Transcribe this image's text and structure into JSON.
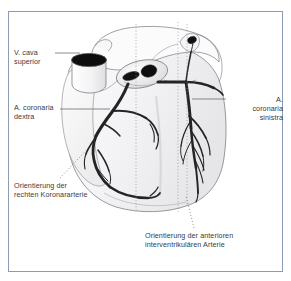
{
  "figure": {
    "type": "anatomical-illustration",
    "frame_color": "#8e9bb5",
    "background_color": "#ffffff",
    "text_color": "#3a3a3c",
    "artery_color": "#2b2b2b",
    "outline_color": "#6e6e73"
  },
  "labels": {
    "vena_cava_superior": "V. cava\nsuperior",
    "a_coronaria_dextra": "A. coronaria\ndextra",
    "a_coronaria_sinistra": "A. coronaria\nsinistra",
    "orientation_rca": "Orientierung der\nrechten Koronararterie",
    "orientation_lad": "Orientierung der anterioren\ninterventrikulären Arterie"
  },
  "anatomy": {
    "vena_cava_opening": "vena-cava-superior-opening",
    "aorta_opening": "aorta-opening",
    "pulmonary_trunk_opening": "pulmonary-trunk-opening",
    "right_coronary_artery": "right-coronary-artery",
    "left_coronary_artery": "left-coronary-artery",
    "anterior_interventricular_artery": "anterior-interventricular-artery",
    "heart_silhouette": "heart-silhouette"
  },
  "guide_lines": {
    "count": 3,
    "style": "dotted-vertical",
    "x_positions": [
      136,
      178,
      187
    ]
  }
}
